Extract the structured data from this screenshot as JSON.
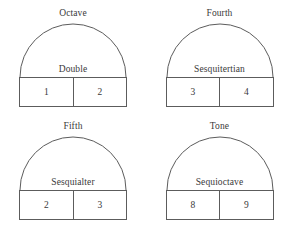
{
  "figure": {
    "stroke_color": "#5c5c5c",
    "background_color": "#ffffff",
    "diagrams": [
      {
        "interval": "Octave",
        "ratio_name": "Double",
        "left_number": "1",
        "right_number": "2"
      },
      {
        "interval": "Fourth",
        "ratio_name": "Sesquitertian",
        "left_number": "3",
        "right_number": "4"
      },
      {
        "interval": "Fifth",
        "ratio_name": "Sesquialter",
        "left_number": "2",
        "right_number": "3"
      },
      {
        "interval": "Tone",
        "ratio_name": "Sequioctave",
        "left_number": "8",
        "right_number": "9"
      }
    ]
  }
}
